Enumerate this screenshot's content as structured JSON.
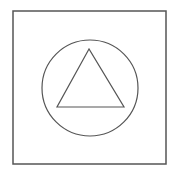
{
  "diagram": {
    "background": "#ffffff",
    "stroke_color": "#555555",
    "frame": {
      "shape": "square",
      "x": 13,
      "y": 11,
      "width": 153,
      "height": 153
    },
    "circle": {
      "shape": "circle",
      "cx": 90,
      "cy": 88,
      "r": 48
    },
    "triangle": {
      "shape": "triangle",
      "points": "89,49 57,107 124,107"
    }
  }
}
